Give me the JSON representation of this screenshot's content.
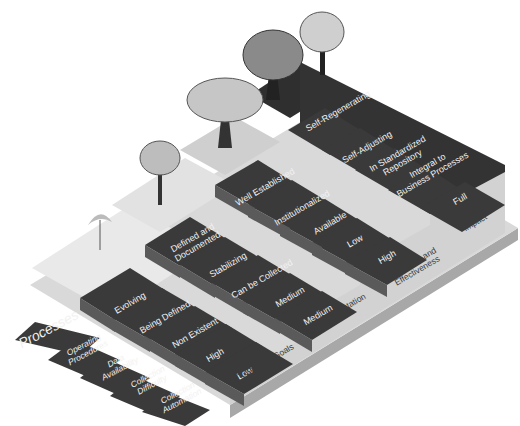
{
  "diagram": {
    "type": "isometric-staircase-maturity-model",
    "colors": {
      "tread_dark": "#3b3b3b",
      "riser_dark": "#555555",
      "step_light": "#d6d6d6",
      "step_lighter": "#e8e8e8",
      "side_face": "#cfcfcf",
      "base": "#bdbdbd",
      "label_text": "#f2f2f2",
      "side_text": "#3a3a3a"
    },
    "row_headers": [
      {
        "id": "processes",
        "label": "Processes"
      },
      {
        "id": "operating-procedures",
        "label": "Operating\nProcedures"
      },
      {
        "id": "data-availability",
        "label": "Data\nAvailability"
      },
      {
        "id": "collection-difficulty",
        "label": "Collection\nDifficulty"
      },
      {
        "id": "collection-automation",
        "label": "Collection\nAutomation"
      }
    ],
    "rows": [
      {
        "header": "Processes",
        "levels": [
          "Evolving",
          "Defined and\nDocumented",
          "Well Established",
          "Self-Regenerating"
        ]
      },
      {
        "header": "Operating Procedures",
        "levels": [
          "Being Defined",
          "Stabilizing",
          "Institutionalized",
          "Self-Adjusting"
        ]
      },
      {
        "header": "Data Availability",
        "levels": [
          "Non Existent",
          "Can be Collected",
          "Available",
          "In Standardized\nRepository"
        ]
      },
      {
        "header": "Collection Difficulty",
        "levels": [
          "High",
          "Medium",
          "Low",
          "Integral to\nBusiness Processes"
        ]
      },
      {
        "header": "Collection Automation",
        "levels": [
          "Low",
          "Medium",
          "High",
          "Full"
        ]
      }
    ],
    "side_labels": [
      "IT Security Goals",
      "Implementation",
      "Efficiency and\nEffectiveness",
      "Business\nImpact"
    ],
    "trees": [
      "sapling",
      "young-tree",
      "mature-tree",
      "large-tree",
      "full-tree"
    ]
  }
}
